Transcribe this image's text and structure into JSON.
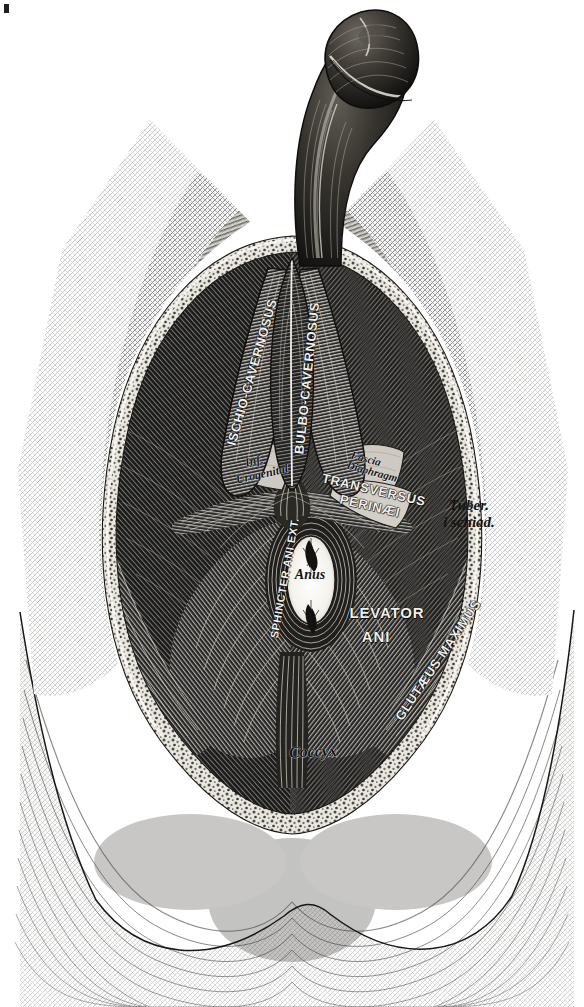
{
  "figure": {
    "medium": "steel engraving, black and white line / cross-hatch",
    "background_color": "#ffffff",
    "ink_color": "#111111",
    "highlight_color": "#f2f0ec"
  },
  "labels": [
    {
      "id": "ischio-cavernosus",
      "text": "ISCHIO-CAVERNOSUS",
      "style": "caps-light",
      "x": 252,
      "y": 372,
      "rotation": -74,
      "size": 13
    },
    {
      "id": "bulbo-cavernosus",
      "text": "BULBO-CAVERNOSUS",
      "style": "caps-light",
      "x": 307,
      "y": 378,
      "rotation": -84,
      "size": 13
    },
    {
      "id": "inf-urogenital-line1",
      "text": "Inf.",
      "style": "italic-dark",
      "x": 254,
      "y": 461,
      "rotation": -13,
      "size": 12
    },
    {
      "id": "inf-urogenital-line2",
      "text": "Urogenital",
      "style": "italic-dark",
      "x": 262,
      "y": 474,
      "rotation": -13,
      "size": 12
    },
    {
      "id": "fascia-diaphragm-line1",
      "text": "Fascia",
      "style": "italic-dark",
      "x": 366,
      "y": 459,
      "rotation": 15,
      "size": 11
    },
    {
      "id": "fascia-diaphragm-line2",
      "text": "Diaphragm",
      "style": "italic-dark",
      "x": 372,
      "y": 472,
      "rotation": 15,
      "size": 11
    },
    {
      "id": "transversus-perinaei-line1",
      "text": "TRANSVERSUS",
      "style": "caps-light",
      "x": 374,
      "y": 490,
      "rotation": 13,
      "size": 13
    },
    {
      "id": "transversus-perinaei-line2",
      "text": "PERINÆI",
      "style": "caps-light",
      "x": 370,
      "y": 506,
      "rotation": 13,
      "size": 13
    },
    {
      "id": "tuber-ischiadicum-line1",
      "text": "Tuber.",
      "style": "italic-light",
      "x": 469,
      "y": 506,
      "rotation": 0,
      "size": 15
    },
    {
      "id": "tuber-ischiadicum-line2",
      "text": "i schiad.",
      "style": "italic-light",
      "x": 469,
      "y": 523,
      "rotation": 0,
      "size": 15
    },
    {
      "id": "sphincter-ani-externus",
      "text": "SPHINCTER ANI EXT.",
      "style": "caps-light",
      "x": 285,
      "y": 578,
      "rotation": -80,
      "size": 11
    },
    {
      "id": "anus",
      "text": "Anus",
      "style": "italic-dark",
      "x": 310,
      "y": 575,
      "rotation": 0,
      "size": 14
    },
    {
      "id": "levator-ani-line1",
      "text": "LEVATOR",
      "style": "caps-light",
      "x": 387,
      "y": 613,
      "rotation": 0,
      "size": 15
    },
    {
      "id": "levator-ani-line2",
      "text": "ANI",
      "style": "caps-light",
      "x": 376,
      "y": 637,
      "rotation": 0,
      "size": 15
    },
    {
      "id": "glutaeus-maximus",
      "text": "GLUTÆUS MAXIMUS",
      "style": "caps-light",
      "x": 438,
      "y": 660,
      "rotation": -56,
      "size": 13
    },
    {
      "id": "coccyx",
      "text": "Coccyx",
      "style": "italic-dark",
      "x": 313,
      "y": 752,
      "rotation": -2,
      "size": 16
    }
  ],
  "structures": [
    "skin flap of thigh (cross-hatched)",
    "reflected subcutaneous fat margin",
    "ischio-cavernosus muscle (paired)",
    "bulbo-cavernosus muscle",
    "inferior fascia of urogenital diaphragm",
    "transversus perinaei muscle",
    "tuber ischiadicum",
    "external anal sphincter",
    "anus",
    "levator ani",
    "gluteus maximus",
    "coccyx",
    "penis (shaft and glans)"
  ]
}
